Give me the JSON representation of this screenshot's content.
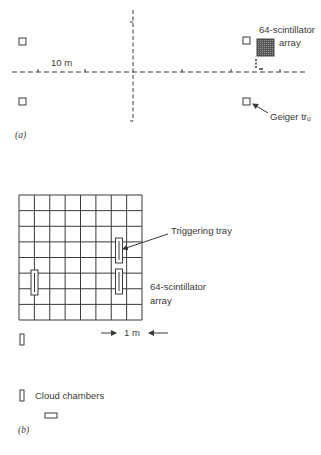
{
  "panel_a": {
    "label": "(a)",
    "scale_label": "10 m",
    "array_label_line1": "64-scintillator",
    "array_label_line2": "array",
    "geiger_label": "Geiger trᵤ"
  },
  "panel_b": {
    "label": "(b)",
    "grid": {
      "rows": 8,
      "cols": 8
    },
    "triggering_tray_label": "Triggering tray",
    "array_label_line1": "64-scintillator",
    "array_label_line2": "array",
    "scale_label": "1 m",
    "cloud_chambers_label": "Cloud chambers"
  },
  "colors": {
    "ink": "#3a3a3a",
    "background": "#ffffff"
  }
}
